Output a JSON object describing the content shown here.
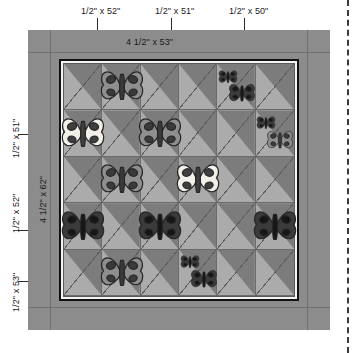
{
  "diagram": {
    "type": "quilt-layout",
    "top_labels": [
      {
        "text": "1/2\" x 52\"",
        "name": "top-border-strip-52"
      },
      {
        "text": "1/2\" x 51\"",
        "name": "top-border-strip-51"
      },
      {
        "text": "1/2\" x 50\"",
        "name": "top-border-strip-50"
      }
    ],
    "top_border_label": "4 1/2\" x 53\"",
    "side_border_label": "4 1/2\" x 62\"",
    "left_labels": [
      {
        "text": "1/2\" x 51\"",
        "name": "left-border-strip-51"
      },
      {
        "text": "1/2\" x 52\"",
        "name": "left-border-strip-52"
      },
      {
        "text": "1/2\" x 53\"",
        "name": "left-border-strip-53"
      }
    ],
    "colors": {
      "outer_border": "#8c8c8c",
      "block_light": "#ababab",
      "block_dark": "#7c7c7c",
      "frame_dark": "#101010",
      "frame_light": "#f4f4f4",
      "butterfly_white": "#f2f0e8",
      "butterfly_mid": "#8e8e8e",
      "butterfly_dark": "#3b3b3b",
      "outline": "#2a2a2a",
      "page_cut_line": "#3a3a3a"
    },
    "grid": {
      "columns": 6,
      "rows": 5,
      "block_style": "half-square-triangle",
      "diagonal_direction": "top-left-to-bottom-right"
    },
    "butterflies": [
      {
        "row": 1,
        "col": 2,
        "tone": "mid",
        "size": "large",
        "flip": false
      },
      {
        "row": 1,
        "col": 5,
        "tone": "dark",
        "size": "small",
        "flip": false
      },
      {
        "row": 1,
        "col": 5,
        "tone": "dark",
        "size": "medium",
        "flip": false
      },
      {
        "row": 2,
        "col": 1,
        "tone": "white",
        "size": "large",
        "flip": false
      },
      {
        "row": 2,
        "col": 3,
        "tone": "mid",
        "size": "large",
        "flip": false
      },
      {
        "row": 2,
        "col": 6,
        "tone": "dark",
        "size": "small",
        "flip": false
      },
      {
        "row": 2,
        "col": 6,
        "tone": "mid",
        "size": "medium",
        "flip": false
      },
      {
        "row": 3,
        "col": 2,
        "tone": "mid",
        "size": "large",
        "flip": false
      },
      {
        "row": 3,
        "col": 4,
        "tone": "white",
        "size": "large",
        "flip": true
      },
      {
        "row": 4,
        "col": 1,
        "tone": "dark",
        "size": "large",
        "flip": false
      },
      {
        "row": 4,
        "col": 3,
        "tone": "dark",
        "size": "large",
        "flip": false
      },
      {
        "row": 4,
        "col": 6,
        "tone": "dark",
        "size": "large",
        "flip": false
      },
      {
        "row": 5,
        "col": 2,
        "tone": "mid",
        "size": "large",
        "flip": false
      },
      {
        "row": 5,
        "col": 4,
        "tone": "dark",
        "size": "small",
        "flip": false
      },
      {
        "row": 5,
        "col": 4,
        "tone": "dark",
        "size": "medium",
        "flip": false
      }
    ]
  }
}
